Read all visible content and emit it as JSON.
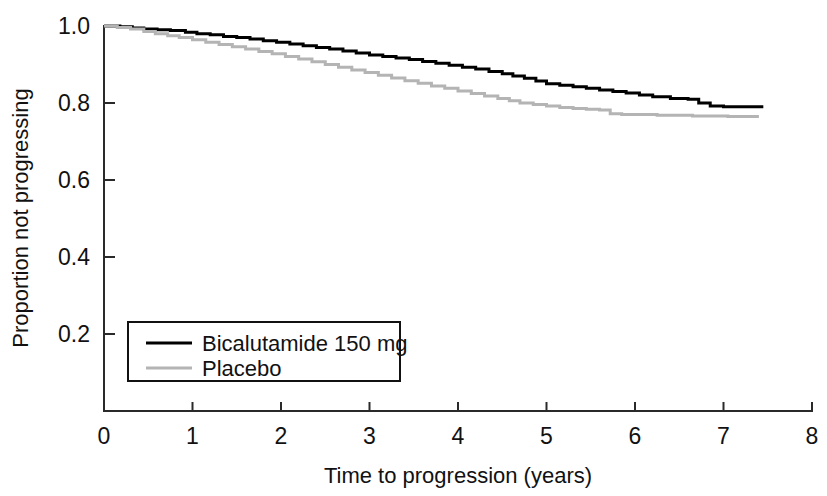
{
  "chart_data": {
    "type": "line",
    "title": "",
    "subtitle": "",
    "xlabel": "Time to progression (years)",
    "ylabel": "Proportion not progressing",
    "xlim": [
      0,
      8
    ],
    "ylim": [
      0,
      1.0
    ],
    "xticks": [
      "0",
      "1",
      "2",
      "3",
      "4",
      "5",
      "6",
      "7",
      "8"
    ],
    "xtick_values": [
      0,
      1,
      2,
      3,
      4,
      5,
      6,
      7,
      8
    ],
    "yticks": [
      "0.2",
      "0.4",
      "0.6",
      "0.8",
      "1.0"
    ],
    "ytick_values": [
      0.2,
      0.4,
      0.6,
      0.8,
      1.0
    ],
    "grid": false,
    "legend_position": "lower left",
    "legend_entries": [
      "Bicalutamide 150 mg",
      "Placebo"
    ],
    "series": [
      {
        "name": "Bicalutamide 150 mg",
        "color": "#000000",
        "style": "step",
        "line_width": 3,
        "x": [
          0.0,
          0.18,
          0.32,
          0.45,
          0.6,
          0.75,
          0.92,
          1.05,
          1.2,
          1.35,
          1.5,
          1.65,
          1.8,
          1.95,
          2.1,
          2.25,
          2.4,
          2.55,
          2.7,
          2.85,
          3.0,
          3.15,
          3.3,
          3.45,
          3.6,
          3.75,
          3.9,
          4.05,
          4.2,
          4.35,
          4.5,
          4.62,
          4.75,
          4.88,
          5.0,
          5.15,
          5.3,
          5.45,
          5.6,
          5.75,
          5.9,
          6.05,
          6.2,
          6.4,
          6.6,
          6.72,
          6.85,
          7.0,
          7.45
        ],
        "y": [
          1.0,
          0.998,
          0.995,
          0.992,
          0.99,
          0.988,
          0.984,
          0.98,
          0.977,
          0.973,
          0.97,
          0.966,
          0.962,
          0.958,
          0.953,
          0.949,
          0.944,
          0.94,
          0.935,
          0.93,
          0.925,
          0.921,
          0.917,
          0.913,
          0.908,
          0.903,
          0.898,
          0.893,
          0.888,
          0.882,
          0.876,
          0.87,
          0.864,
          0.857,
          0.85,
          0.846,
          0.842,
          0.838,
          0.834,
          0.83,
          0.826,
          0.821,
          0.816,
          0.812,
          0.81,
          0.8,
          0.792,
          0.79,
          0.79
        ]
      },
      {
        "name": "Placebo",
        "color": "#b4b4b4",
        "style": "step",
        "line_width": 3,
        "x": [
          0.0,
          0.15,
          0.3,
          0.45,
          0.58,
          0.72,
          0.85,
          1.0,
          1.15,
          1.3,
          1.45,
          1.6,
          1.75,
          1.9,
          2.05,
          2.2,
          2.35,
          2.5,
          2.65,
          2.8,
          2.95,
          3.1,
          3.25,
          3.4,
          3.55,
          3.7,
          3.85,
          4.0,
          4.15,
          4.3,
          4.45,
          4.58,
          4.7,
          4.85,
          5.0,
          5.15,
          5.3,
          5.45,
          5.6,
          5.72,
          5.85,
          6.05,
          6.25,
          6.45,
          6.65,
          6.85,
          7.05,
          7.4
        ],
        "y": [
          1.0,
          0.996,
          0.992,
          0.986,
          0.98,
          0.975,
          0.97,
          0.964,
          0.958,
          0.952,
          0.946,
          0.94,
          0.934,
          0.928,
          0.921,
          0.914,
          0.907,
          0.9,
          0.893,
          0.886,
          0.879,
          0.872,
          0.865,
          0.858,
          0.851,
          0.844,
          0.838,
          0.831,
          0.825,
          0.818,
          0.812,
          0.806,
          0.8,
          0.796,
          0.792,
          0.788,
          0.786,
          0.784,
          0.782,
          0.772,
          0.77,
          0.77,
          0.768,
          0.768,
          0.766,
          0.766,
          0.765,
          0.765
        ]
      }
    ]
  }
}
